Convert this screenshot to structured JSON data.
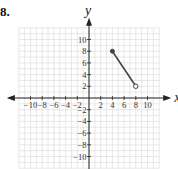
{
  "problem": {
    "number": "8."
  },
  "chart_data": {
    "type": "line",
    "title": "",
    "xlabel": "x",
    "ylabel": "y",
    "xlim": [
      -12,
      12
    ],
    "ylim": [
      -12,
      12
    ],
    "grid": true,
    "x_ticks": [
      -10,
      -8,
      -6,
      -4,
      -2,
      2,
      4,
      6,
      8,
      10
    ],
    "y_ticks": [
      10,
      8,
      6,
      4,
      2,
      -2,
      -4,
      -6,
      -8,
      -10
    ],
    "x_tick_labels": [
      "−10",
      "−8",
      "−6",
      "−4",
      "−2",
      "2",
      "4",
      "6",
      "8",
      "10"
    ],
    "y_tick_labels": [
      "10",
      "8",
      "6",
      "4",
      "2",
      "−2",
      "−4",
      "−6",
      "−8",
      "−10"
    ],
    "series": [
      {
        "name": "segment",
        "points": [
          {
            "x": 4,
            "y": 8
          },
          {
            "x": 8,
            "y": 2
          }
        ],
        "start_marker": "closed",
        "end_marker": "open"
      }
    ]
  },
  "colors": {
    "grid": "#d8d8d8",
    "axis": "#222222",
    "segment": "#444444"
  }
}
